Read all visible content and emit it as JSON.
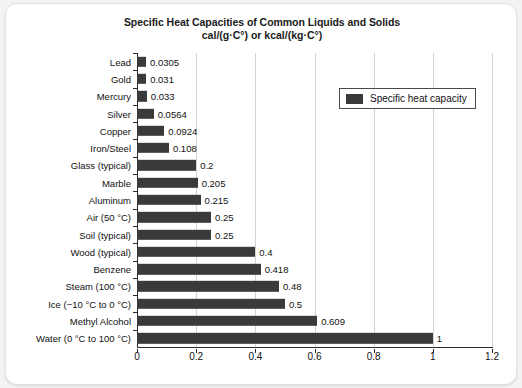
{
  "card": {
    "background": "#ffffff",
    "border_color": "#e2e2e2"
  },
  "legend": {
    "label": "Specific heat capacity",
    "position": "top-right",
    "swatch_color": "#3a3a3a"
  },
  "chart_data": {
    "type": "bar",
    "orientation": "horizontal",
    "title": "Specific Heat Capacities of Common Liquids and Solids",
    "subtitle": "cal/(g·C°) or kcal/(kg·C°)",
    "xlabel": "",
    "ylabel": "",
    "xlim": [
      0,
      1.2
    ],
    "xticks": [
      "0",
      "0.2",
      "0.4",
      "0.6",
      "0.8",
      "1",
      "1.2"
    ],
    "xtick_values": [
      0,
      0.2,
      0.4,
      0.6,
      0.8,
      1,
      1.2
    ],
    "grid": "vertical",
    "legend_position": "top-right",
    "series_name": "Specific heat capacity",
    "bar_color": "#3a3a3a",
    "categories": [
      "Lead",
      "Gold",
      "Mercury",
      "Silver",
      "Copper",
      "Iron/Steel",
      "Glass (typical)",
      "Marble",
      "Aluminum",
      "Air (50 °C)",
      "Soil (typical)",
      "Wood (typical)",
      "Benzene",
      "Steam (100 °C)",
      "Ice (−10 °C to 0 °C)",
      "Methyl Alcohol",
      "Water (0 °C to 100 °C)"
    ],
    "values": [
      0.0305,
      0.031,
      0.033,
      0.0564,
      0.0924,
      0.108,
      0.2,
      0.205,
      0.215,
      0.25,
      0.25,
      0.4,
      0.418,
      0.48,
      0.5,
      0.609,
      1
    ],
    "value_labels": [
      "0.0305",
      "0.031",
      "0.033",
      "0.0564",
      "0.0924",
      "0.108",
      "0.2",
      "0.205",
      "0.215",
      "0.25",
      "0.25",
      "0.4",
      "0.418",
      "0.48",
      "0.5",
      "0.609",
      "1"
    ]
  }
}
